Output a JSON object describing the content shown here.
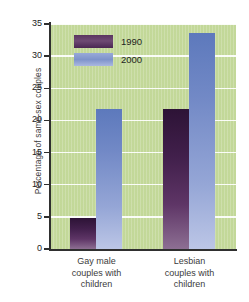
{
  "chart_data": {
    "type": "bar",
    "title": "",
    "subtitle": "",
    "xlabel": "",
    "ylabel": "Percentage of same-sex couples",
    "categories": [
      "Gay male couples with children",
      "Lesbian couples with children"
    ],
    "category_lines": [
      [
        "Gay male",
        "couples with",
        "children"
      ],
      [
        "Lesbian",
        "couples with",
        "children"
      ]
    ],
    "series": [
      {
        "name": "1990",
        "values": [
          4.9,
          21.8
        ],
        "color": "#4a2752"
      },
      {
        "name": "2000",
        "values": [
          21.8,
          33.6
        ],
        "color": "#7e93cb"
      }
    ],
    "ylim": [
      0,
      35
    ],
    "yticks": [
      0,
      5,
      10,
      15,
      20,
      25,
      30,
      35
    ],
    "ytick_labels": [
      "0",
      "5",
      "10",
      "15",
      "20",
      "25",
      "30",
      "35"
    ],
    "grid": true,
    "grid_axis": "y",
    "legend_position": "upper-left-inside",
    "plot_background_color": "#c3d89a",
    "gridline_color": "#ffffff",
    "axis_color": "#2f2f2f"
  },
  "legend": {
    "entries": [
      {
        "label": "1990"
      },
      {
        "label": "2000"
      }
    ]
  }
}
